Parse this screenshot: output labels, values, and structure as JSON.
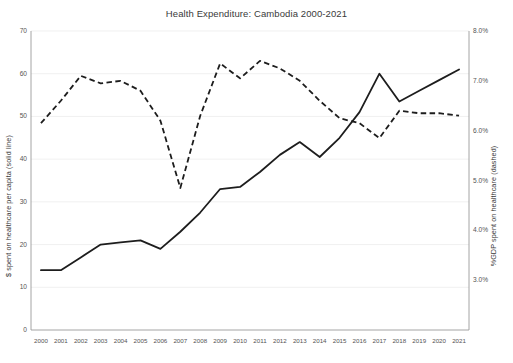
{
  "chart_data": {
    "type": "line",
    "title": "Health Expenditure: Cambodia 2000-2021",
    "xlabel": "",
    "grid": true,
    "legend": "none",
    "categories": [
      "2000",
      "2001",
      "2002",
      "2003",
      "2004",
      "2005",
      "2006",
      "2007",
      "2008",
      "2009",
      "2010",
      "2011",
      "2012",
      "2013",
      "2014",
      "2015",
      "2016",
      "2017",
      "2018",
      "2019",
      "2020",
      "2021"
    ],
    "axes": {
      "left": {
        "label": "$ spent on healthcare per capita (solid line)",
        "ylim": [
          0,
          70
        ],
        "ticks": [
          0,
          10,
          20,
          30,
          40,
          50,
          60,
          70
        ],
        "tick_labels": [
          "0",
          "10",
          "20",
          "30",
          "40",
          "50",
          "60",
          "70"
        ]
      },
      "right": {
        "label": "%GDP spent on healthcare (dashed)",
        "ylim": [
          2.0,
          8.0
        ],
        "ticks": [
          3.0,
          4.0,
          5.0,
          6.0,
          7.0,
          8.0
        ],
        "tick_labels": [
          "3.0%",
          "4.0%",
          "5.0%",
          "6.0%",
          "7.0%",
          "8.0%"
        ]
      }
    },
    "series": [
      {
        "name": "$ spent on healthcare per capita",
        "style": "solid",
        "axis": "left",
        "color": "#1d1d1d",
        "values": [
          14,
          14,
          17,
          20,
          20.5,
          21,
          19,
          23,
          27.5,
          33,
          33.5,
          37,
          41,
          44,
          40.5,
          45,
          51,
          60,
          53.5,
          56,
          58.5,
          61
        ]
      },
      {
        "name": "%GDP spent on healthcare",
        "style": "dashed",
        "axis": "right",
        "color": "#1d1d1d",
        "values": [
          6.15,
          6.6,
          7.1,
          6.95,
          7.0,
          6.8,
          6.2,
          4.85,
          6.3,
          7.35,
          7.05,
          7.4,
          7.25,
          7.0,
          6.6,
          6.25,
          6.15,
          5.85,
          6.4,
          6.35,
          6.35,
          6.3
        ]
      }
    ]
  }
}
